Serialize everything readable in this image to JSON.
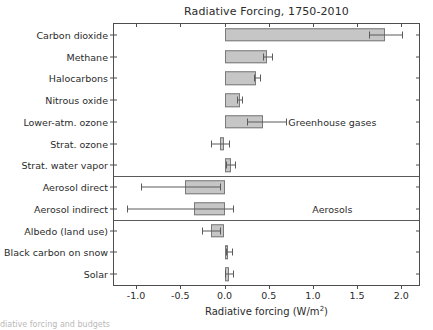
{
  "chart_data": {
    "type": "bar",
    "orientation": "horizontal",
    "title": "Radiative Forcing, 1750-2010",
    "xlabel": "Radiative forcing (W/m",
    "xlabel_sup": "2",
    "xlabel_tail": ")",
    "ylabel": "",
    "xlim": [
      -1.25,
      2.2
    ],
    "xticks": [
      -1.0,
      -0.5,
      0.0,
      0.5,
      1.0,
      1.5,
      2.0
    ],
    "xticklabels": [
      "-1.0",
      "-0.5",
      "0.0",
      "0.5",
      "1.0",
      "1.5",
      "2.0"
    ],
    "grid": false,
    "legend_position": "none",
    "bar_color": "#c6c6c6",
    "bar_edge_color": "#7a7a7a",
    "error_color": "#5a5a5a",
    "axis_color": "#4d4d4d",
    "categories": [
      "Carbon dioxide",
      "Methane",
      "Halocarbons",
      "Nitrous oxide",
      "Lower-atm. ozone",
      "Strat. ozone",
      "Strat. water vapor",
      "Aerosol direct",
      "Aerosol indirect",
      "Albedo (land use)",
      "Black carbon on snow",
      "Solar"
    ],
    "values": [
      1.82,
      0.48,
      0.36,
      0.17,
      0.44,
      -0.05,
      0.07,
      -0.45,
      -0.35,
      -0.15,
      0.04,
      0.05
    ],
    "err_low": [
      1.63,
      0.44,
      0.33,
      0.14,
      0.26,
      -0.15,
      0.02,
      -0.95,
      -1.1,
      -0.25,
      0.02,
      0.01
    ],
    "err_high": [
      2.01,
      0.54,
      0.4,
      0.2,
      0.7,
      0.05,
      0.12,
      -0.05,
      0.1,
      -0.05,
      0.09,
      0.1
    ],
    "annotations": [
      {
        "text": "Greenhouse gases",
        "x": 1.22,
        "y_index": 4
      },
      {
        "text": "Aerosols",
        "x": 1.22,
        "y_index": 8
      }
    ],
    "group_dividers": [
      {
        "after_index": 6,
        "label": "Greenhouse gases"
      },
      {
        "after_index": 8,
        "label": "Aerosols"
      }
    ]
  },
  "caption": {
    "text": "diative forcing and budgets"
  }
}
